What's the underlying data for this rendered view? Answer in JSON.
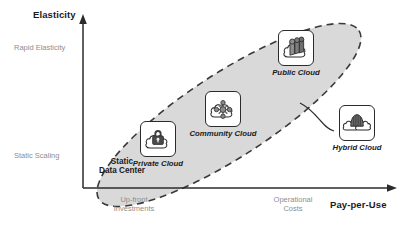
{
  "diagram": {
    "type": "cloud-deployment-models-positioning-chart",
    "y_axis": {
      "title": "Elasticity",
      "high_label": "Rapid Elasticity",
      "low_label": "Static Scaling"
    },
    "x_axis": {
      "title": "Pay-per-Use",
      "low_label_line1": "Up-front",
      "low_label_line2": "Investments",
      "high_label_line1": "Operational",
      "high_label_line2": "Costs"
    },
    "region": {
      "name": "cloud-continuum-ellipse",
      "fill": "#d9d9d9",
      "stroke": "#3a3a3a",
      "stroke_style": "dashed",
      "rotation_deg": -33
    },
    "origin_label_line1": "Static",
    "origin_label_line2": "Data Center",
    "nodes": [
      {
        "id": "private-cloud",
        "label": "Private Cloud",
        "icon": "cloud-with-padlock-icon",
        "inside_region": true
      },
      {
        "id": "community-cloud",
        "label": "Community Cloud",
        "icon": "cloud-with-network-nodes-icon",
        "inside_region": true
      },
      {
        "id": "public-cloud",
        "label": "Public Cloud",
        "icon": "cloud-with-servers-icon",
        "inside_region": true
      },
      {
        "id": "hybrid-cloud",
        "label": "Hybrid Cloud",
        "icon": "two-clouds-with-dome-icon",
        "inside_region": false
      }
    ],
    "connector": {
      "from": "cloud-continuum-ellipse",
      "to": "hybrid-cloud",
      "style": "curved-solid-line"
    },
    "colors": {
      "axis": "#2b2b2b",
      "text_dark": "#1b1b1b",
      "text_muted": "#8e8e8e",
      "region_fill": "#d9d9d9",
      "icon_dark": "#4a4a4a",
      "icon_mid": "#8a8a8a",
      "background": "#ffffff"
    }
  }
}
